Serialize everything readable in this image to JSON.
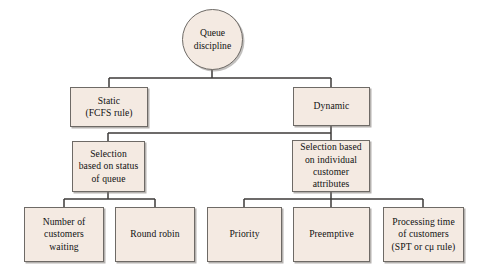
{
  "diagram": {
    "palette": {
      "node_fill": "#f4eae2",
      "node_border": "#6e6a66",
      "connector": "#3c3a38",
      "text": "#111111",
      "background": "#ffffff"
    },
    "root": {
      "id": "queue-discipline",
      "label": "Queue\ndiscipline",
      "shape": "ellipse"
    },
    "level1": [
      {
        "id": "static",
        "label": "Static\n(FCFS rule)",
        "shape": "rect"
      },
      {
        "id": "dynamic",
        "label": "Dynamic",
        "shape": "rect"
      }
    ],
    "level2": [
      {
        "id": "selection-status-queue",
        "label": "Selection\nbased on status\nof queue",
        "shape": "rect",
        "parent": "dynamic"
      },
      {
        "id": "selection-individual-attributes",
        "label": "Selection based\non individual\ncustomer\nattributes",
        "shape": "rect",
        "parent": "dynamic"
      }
    ],
    "level3": [
      {
        "id": "number-of-customers-waiting",
        "label": "Number of\ncustomers\nwaiting",
        "shape": "rect",
        "parent": "selection-status-queue"
      },
      {
        "id": "round-robin",
        "label": "Round robin",
        "shape": "rect",
        "parent": "selection-status-queue"
      },
      {
        "id": "priority",
        "label": "Priority",
        "shape": "rect",
        "parent": "selection-individual-attributes"
      },
      {
        "id": "preemptive",
        "label": "Preemptive",
        "shape": "rect",
        "parent": "selection-individual-attributes"
      },
      {
        "id": "processing-time-of-customers",
        "label": "Processing time\nof customers\n(SPT or cμ rule)",
        "shape": "rect",
        "parent": "selection-individual-attributes"
      }
    ]
  }
}
